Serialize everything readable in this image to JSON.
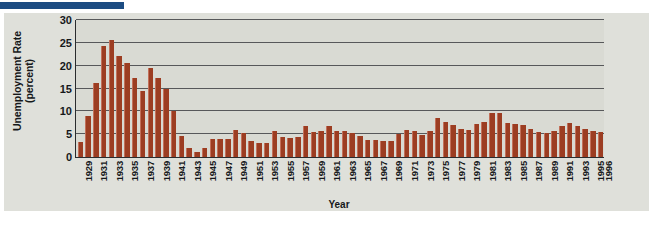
{
  "figure": {
    "y_axis_title_main": "Unemployment Rate",
    "y_axis_title_sub": "(percent)",
    "x_axis_title": "Year",
    "bar_color": "#9c3d22",
    "panel_color": "#dfe0da",
    "plot_color": "#d9dad3",
    "gridline_color": "#57585a",
    "axis_color": "#2a2c2e",
    "accent_rule_color": "#1c4c82"
  },
  "chart_data": {
    "type": "bar",
    "title": "",
    "xlabel": "Year",
    "ylabel": "Unemployment Rate (percent)",
    "ylim": [
      0,
      30
    ],
    "yticks": [
      0,
      5,
      10,
      15,
      20,
      25,
      30
    ],
    "grid": true,
    "legend": "none",
    "x_tick_labels": [
      "1929",
      "1931",
      "1933",
      "1935",
      "1937",
      "1939",
      "1941",
      "1943",
      "1945",
      "1947",
      "1949",
      "1951",
      "1953",
      "1955",
      "1957",
      "1959",
      "1961",
      "1963",
      "1965",
      "1967",
      "1969",
      "1971",
      "1973",
      "1975",
      "1977",
      "1979",
      "1981",
      "1983",
      "1985",
      "1987",
      "1989",
      "1991",
      "1993",
      "1995",
      "1996"
    ],
    "categories": [
      "1929",
      "1930",
      "1931",
      "1932",
      "1933",
      "1934",
      "1935",
      "1936",
      "1937",
      "1938",
      "1939",
      "1940",
      "1941",
      "1942",
      "1943",
      "1944",
      "1945",
      "1946",
      "1947",
      "1948",
      "1949",
      "1950",
      "1951",
      "1952",
      "1953",
      "1954",
      "1955",
      "1956",
      "1957",
      "1958",
      "1959",
      "1960",
      "1961",
      "1962",
      "1963",
      "1964",
      "1965",
      "1966",
      "1967",
      "1968",
      "1969",
      "1970",
      "1971",
      "1972",
      "1973",
      "1974",
      "1975",
      "1976",
      "1977",
      "1978",
      "1979",
      "1980",
      "1981",
      "1982",
      "1983",
      "1984",
      "1985",
      "1986",
      "1987",
      "1988",
      "1989",
      "1990",
      "1991",
      "1992",
      "1993",
      "1994",
      "1995",
      "1996"
    ],
    "values": [
      3.2,
      8.9,
      16.3,
      24.3,
      25.6,
      22.2,
      20.5,
      17.2,
      14.5,
      19.4,
      17.3,
      14.8,
      10.0,
      4.7,
      1.9,
      1.2,
      1.9,
      4.0,
      4.0,
      3.9,
      6.0,
      5.3,
      3.4,
      3.1,
      3.0,
      5.6,
      4.4,
      4.2,
      4.3,
      6.8,
      5.5,
      5.6,
      6.7,
      5.6,
      5.7,
      5.2,
      4.5,
      3.8,
      3.8,
      3.6,
      3.5,
      5.0,
      6.0,
      5.6,
      4.9,
      5.6,
      8.5,
      7.7,
      7.1,
      6.1,
      5.9,
      7.2,
      7.6,
      9.7,
      9.6,
      7.5,
      7.2,
      7.0,
      6.2,
      5.5,
      5.3,
      5.6,
      6.8,
      7.5,
      6.9,
      6.1,
      5.6,
      5.4
    ]
  }
}
